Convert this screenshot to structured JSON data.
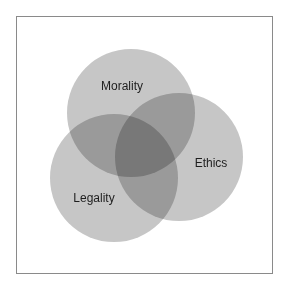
{
  "diagram": {
    "type": "venn",
    "sets": [
      {
        "label": "Morality",
        "cx": 131,
        "cy": 113,
        "r": 64
      },
      {
        "label": "Ethics",
        "cx": 179,
        "cy": 157,
        "r": 64
      },
      {
        "label": "Legality",
        "cx": 114,
        "cy": 178,
        "r": 64
      }
    ],
    "colors": {
      "single": "#c6c6c6",
      "double": "#9a9a9a",
      "triple": "#6e6e6e",
      "border": "#8a8a8a",
      "text": "#1e1e1e"
    }
  },
  "labels": {
    "morality": "Morality",
    "ethics": "Ethics",
    "legality": "Legality"
  }
}
